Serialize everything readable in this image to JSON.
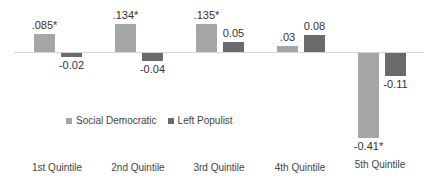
{
  "chart_data": {
    "type": "bar",
    "title": "",
    "xlabel": "",
    "ylabel": "",
    "categories": [
      "1st Quintile",
      "2nd Quintile",
      "3rd Quintile",
      "4th Quintile",
      "5th Quintile"
    ],
    "series": [
      {
        "name": "Social Democratic",
        "color": "#a6a6a6",
        "values": [
          0.085,
          0.134,
          0.135,
          0.03,
          -0.41
        ],
        "labels": [
          ".085*",
          ".134*",
          ".135*",
          ".03",
          "-0.41*"
        ]
      },
      {
        "name": "Left Populist",
        "color": "#6b6b6b",
        "values": [
          -0.02,
          -0.04,
          0.05,
          0.08,
          -0.11
        ],
        "labels": [
          "-0.02",
          "-0.04",
          "0.05",
          "0.08",
          "-0.11"
        ]
      }
    ],
    "ylim": [
      -0.45,
      0.16
    ],
    "grid": false,
    "legend_position": "inside-left-middle",
    "annotations": "* indicates statistical significance"
  },
  "legend": {
    "items": [
      {
        "label": "Social Democratic",
        "color": "#a6a6a6"
      },
      {
        "label": "Left Populist",
        "color": "#6b6b6b"
      }
    ]
  }
}
